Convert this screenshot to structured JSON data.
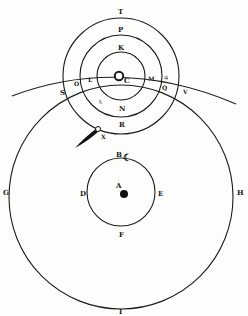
{
  "diagram": {
    "type": "geo-heliocentric astronomical model",
    "colors": {
      "ink": "#1c1c1c",
      "paper": "#fdfdfc"
    },
    "sun_system": {
      "center_label": "C",
      "center_symbol": "sun-symbol",
      "orbits": [
        {
          "id": "inner",
          "labels": [
            "K",
            "N"
          ]
        },
        {
          "id": "middle",
          "labels": [
            "P",
            "R"
          ]
        },
        {
          "id": "outer",
          "labels": [
            "T"
          ]
        }
      ]
    },
    "ecliptic_arc": {
      "labels": [
        "S",
        "O",
        "L",
        "M",
        "Q",
        "V"
      ]
    },
    "planet_symbols": [
      {
        "label": "planet-symbol-near-N",
        "glyph": "♄"
      },
      {
        "label": "planet-symbol-near-M",
        "glyph": "♃"
      }
    ],
    "comet": {
      "label": "X",
      "symbol": "comet"
    },
    "sun_orbit": {
      "labels": [
        "G",
        "H",
        "I"
      ]
    },
    "moon_orbit": {
      "labels": [
        "B",
        "D",
        "E",
        "F"
      ],
      "moon_symbol": "☾"
    },
    "earth": {
      "label": "A"
    },
    "labels": {
      "T": "T",
      "P": "P",
      "K": "K",
      "C": "C",
      "L": "L",
      "M": "M",
      "O": "O",
      "S": "S",
      "Q": "Q",
      "V": "V",
      "N": "N",
      "R": "R",
      "X": "X",
      "B": "B",
      "D": "D",
      "E": "E",
      "F": "F",
      "A": "A",
      "G": "G",
      "H": "H",
      "I": "I",
      "moon": "☾",
      "planet1": "♄",
      "planet2": "♃"
    }
  }
}
